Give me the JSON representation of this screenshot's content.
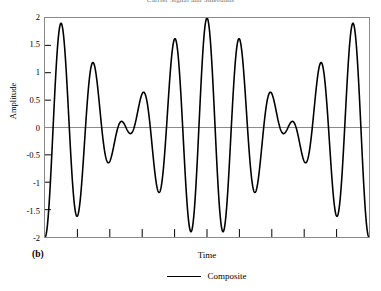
{
  "chart_data": {
    "type": "line",
    "title": "Carrier Signal and Sidebands",
    "xlabel": "Time",
    "ylabel": "Amplitude",
    "subfigure_label": "(b)",
    "ylim": [
      -2,
      2
    ],
    "yticks": [
      2,
      1.5,
      1,
      0.5,
      0,
      -0.5,
      -1,
      -1.5,
      -2
    ],
    "ytick_labels": [
      "2",
      "1.5",
      "1",
      "0.5",
      "0",
      "-0.5",
      "-1",
      "-1.5",
      "-2"
    ],
    "xlim": [
      0,
      10
    ],
    "xticks": [
      0,
      1,
      2,
      3,
      4,
      5,
      6,
      7,
      8,
      9,
      10
    ],
    "xtick_labels": [
      "",
      "",
      "",
      "",
      "",
      "",
      "",
      "",
      "",
      "",
      ""
    ],
    "grid": false,
    "legend_position": "bottom-center",
    "zero_line": true,
    "series": [
      {
        "name": "Composite",
        "color": "#000000",
        "line_width": 1.6,
        "formula": "2 * cos(pi * (t - 5) / 5) * cos(2 * pi * t)",
        "description": "Beat pattern: sum of two equal-amplitude cosines of nearly equal frequency. Envelope peaks at amplitude 2 at both ends and collapses to a node at the centre.",
        "envelope_peaks": [
          {
            "t": 0.0,
            "value": 2.0
          },
          {
            "t": 1.0,
            "value": 1.78
          },
          {
            "t": 2.0,
            "value": 1.3
          },
          {
            "t": 3.0,
            "value": 0.73
          },
          {
            "t": 4.0,
            "value": 0.22
          },
          {
            "t": 5.0,
            "value": 0.06
          },
          {
            "t": 6.0,
            "value": 0.22
          },
          {
            "t": 7.0,
            "value": 0.73
          },
          {
            "t": 8.0,
            "value": 1.3
          },
          {
            "t": 9.0,
            "value": 1.78
          },
          {
            "t": 10.0,
            "value": 2.0
          }
        ],
        "envelope_troughs": [
          {
            "t": 0.5,
            "value": -1.98
          },
          {
            "t": 1.5,
            "value": -1.6
          },
          {
            "t": 2.5,
            "value": -1.02
          },
          {
            "t": 3.5,
            "value": -0.45
          },
          {
            "t": 4.5,
            "value": -0.1
          },
          {
            "t": 5.5,
            "value": -0.1
          },
          {
            "t": 6.5,
            "value": -0.45
          },
          {
            "t": 7.5,
            "value": -1.02
          },
          {
            "t": 8.5,
            "value": -1.6
          },
          {
            "t": 9.5,
            "value": -1.98
          }
        ]
      }
    ]
  },
  "legend": {
    "items": [
      {
        "label": "Composite",
        "color": "#000000"
      }
    ]
  }
}
